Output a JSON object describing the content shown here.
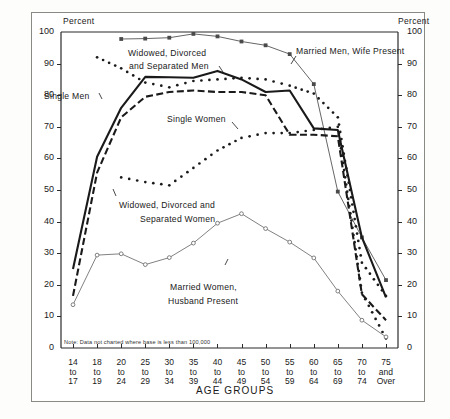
{
  "chart_data": {
    "type": "line",
    "title": "",
    "xlabel": "AGE GROUPS",
    "ylabel": "Percent",
    "ylabel_right": "Percent",
    "ylim": [
      0,
      100
    ],
    "ytick_values": [
      0,
      10,
      20,
      30,
      40,
      50,
      60,
      70,
      80,
      90,
      100
    ],
    "grid": false,
    "legend_position": "inline-annotations",
    "note": "Note: Data not charted where base is less than 100,000",
    "categories": [
      "14 to 17",
      "18 to 19",
      "20 to 24",
      "25 to 29",
      "30 to 34",
      "35 to 39",
      "40 to 44",
      "45 to 49",
      "50 to 54",
      "55 to 59",
      "60 to 64",
      "65 to 69",
      "70 to 74",
      "75 and Over"
    ],
    "category_lines": [
      [
        "14",
        "to",
        "17"
      ],
      [
        "18",
        "to",
        "19"
      ],
      [
        "20",
        "to",
        "24"
      ],
      [
        "25",
        "to",
        "29"
      ],
      [
        "30",
        "to",
        "34"
      ],
      [
        "35",
        "to",
        "39"
      ],
      [
        "40",
        "to",
        "44"
      ],
      [
        "45",
        "to",
        "49"
      ],
      [
        "50",
        "to",
        "54"
      ],
      [
        "55",
        "to",
        "59"
      ],
      [
        "60",
        "to",
        "64"
      ],
      [
        "65",
        "to",
        "69"
      ],
      [
        "70",
        "to",
        "74"
      ],
      [
        "75",
        "and",
        "Over"
      ]
    ],
    "series": [
      {
        "name": "Married Men, Wife Present",
        "style": "thin-solid-with-square-markers",
        "color": "#4a4a4a",
        "values": [
          null,
          null,
          97.8,
          97.9,
          98.2,
          99.4,
          98.6,
          97.0,
          95.8,
          93.0,
          83.5,
          49.5,
          35.0,
          21.5
        ]
      },
      {
        "name": "Single Men",
        "style": "thick-solid",
        "color": "#1a1a1a",
        "values": [
          25.0,
          60.5,
          76.0,
          85.8,
          85.7,
          85.5,
          87.7,
          85.0,
          81.0,
          81.5,
          69.5,
          69.0,
          35.0,
          16.0
        ]
      },
      {
        "name": "Single Women",
        "style": "thick-dashed",
        "color": "#1a1a1a",
        "values": [
          16.5,
          55.5,
          73.0,
          79.5,
          81.0,
          81.5,
          81.0,
          81.0,
          80.0,
          67.5,
          67.5,
          67.0,
          17.0,
          8.8
        ]
      },
      {
        "name": "Widowed, Divorced and Separated Men",
        "style": "dotted",
        "color": "#1a1a1a",
        "values": [
          null,
          92.0,
          88.5,
          84.0,
          82.5,
          84.5,
          85.0,
          85.5,
          85.0,
          83.0,
          80.5,
          73.0,
          27.0,
          16.5
        ]
      },
      {
        "name": "Widowed, Divorced and Separated Women",
        "style": "dotted",
        "color": "#1a1a1a",
        "values": [
          null,
          null,
          54.0,
          52.5,
          51.5,
          57.0,
          62.5,
          66.5,
          68.0,
          68.0,
          69.0,
          70.0,
          17.5,
          3.0
        ]
      },
      {
        "name": "Married Women, Husband Present",
        "style": "thin-solid-with-circle-markers",
        "color": "#6a6a6a",
        "values": [
          13.7,
          29.4,
          29.8,
          26.4,
          28.6,
          33.2,
          39.5,
          42.5,
          37.8,
          33.5,
          28.5,
          18.0,
          8.8,
          3.5
        ]
      }
    ],
    "annotations": [
      {
        "text": "Married Men, Wife Present",
        "x": 296,
        "y": 46
      },
      {
        "text": "Widowed, Divorced",
        "x": 128,
        "y": 48
      },
      {
        "text": "and Separated Men",
        "x": 129,
        "y": 61
      },
      {
        "text": "Single Men",
        "x": 44,
        "y": 91
      },
      {
        "text": "Single Women",
        "x": 167,
        "y": 114
      },
      {
        "text": "Widowed, Divorced and",
        "x": 119,
        "y": 200
      },
      {
        "text": "Separated Women",
        "x": 140,
        "y": 214
      },
      {
        "text": "Married Women,",
        "x": 170,
        "y": 282
      },
      {
        "text": "Husband Present",
        "x": 168,
        "y": 296
      }
    ]
  },
  "colors": {
    "frame": "#8a8a84",
    "axis": "#2b2b2b",
    "ink": "#1a1a1a",
    "light_ink": "#6a6a6a",
    "background": "#ffffff"
  }
}
